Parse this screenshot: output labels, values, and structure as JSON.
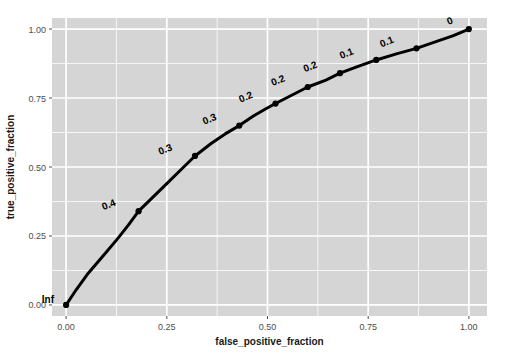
{
  "chart_data": {
    "type": "line",
    "title": "",
    "xlabel": "false_positive_fraction",
    "ylabel": "true_positive_fraction",
    "xlim": [
      -0.035,
      1.045
    ],
    "ylim": [
      -0.04,
      1.04
    ],
    "grid": true,
    "legend": false,
    "xticks": [
      "0.00",
      "0.25",
      "0.50",
      "0.75",
      "1.00"
    ],
    "xtickvals": [
      0,
      0.25,
      0.5,
      0.75,
      1.0
    ],
    "yticks": [
      "0.00",
      "0.25",
      "0.50",
      "0.75",
      "1.00"
    ],
    "ytickvals": [
      0,
      0.25,
      0.5,
      0.75,
      1.0
    ],
    "minor_xtickvals": [
      0.125,
      0.375,
      0.625,
      0.875
    ],
    "minor_ytickvals": [
      0.125,
      0.375,
      0.625,
      0.875
    ],
    "series": [
      {
        "name": "roc-curve",
        "color": "#000000",
        "x": [
          0.0,
          0.025,
          0.055,
          0.09,
          0.125,
          0.155,
          0.18,
          0.215,
          0.25,
          0.285,
          0.32,
          0.36,
          0.395,
          0.43,
          0.465,
          0.495,
          0.52,
          0.56,
          0.6,
          0.645,
          0.68,
          0.72,
          0.77,
          0.82,
          0.87,
          0.92,
          0.96,
          1.0
        ],
        "y": [
          0.0,
          0.055,
          0.115,
          0.175,
          0.235,
          0.29,
          0.34,
          0.39,
          0.44,
          0.49,
          0.54,
          0.585,
          0.62,
          0.65,
          0.685,
          0.71,
          0.73,
          0.76,
          0.79,
          0.815,
          0.84,
          0.862,
          0.888,
          0.91,
          0.93,
          0.955,
          0.975,
          1.0
        ]
      }
    ],
    "points": [
      {
        "x": 0.0,
        "y": 0.0,
        "label": "Inf",
        "lx": -0.03,
        "ly": 0.008,
        "rot": 0
      },
      {
        "x": 0.18,
        "y": 0.34,
        "label": "0.4",
        "lx": -0.055,
        "ly": 0.022,
        "rot": -22
      },
      {
        "x": 0.32,
        "y": 0.54,
        "label": "0.3",
        "lx": -0.055,
        "ly": 0.022,
        "rot": -22
      },
      {
        "x": 0.43,
        "y": 0.65,
        "label": "0.3",
        "lx": -0.055,
        "ly": 0.022,
        "rot": -22
      },
      {
        "x": 0.52,
        "y": 0.73,
        "label": "0.2",
        "lx": -0.055,
        "ly": 0.022,
        "rot": -22
      },
      {
        "x": 0.6,
        "y": 0.79,
        "label": "0.2",
        "lx": -0.055,
        "ly": 0.022,
        "rot": -22
      },
      {
        "x": 0.68,
        "y": 0.84,
        "label": "0.2",
        "lx": -0.055,
        "ly": 0.022,
        "rot": -22
      },
      {
        "x": 0.77,
        "y": 0.888,
        "label": "0.1",
        "lx": -0.055,
        "ly": 0.022,
        "rot": -22
      },
      {
        "x": 0.87,
        "y": 0.93,
        "label": "0.1",
        "lx": -0.055,
        "ly": 0.022,
        "rot": -22
      },
      {
        "x": 1.0,
        "y": 1.0,
        "label": "0",
        "lx": -0.038,
        "ly": 0.022,
        "rot": -22
      }
    ],
    "style": {
      "panel_bg": "#d5d5d5",
      "grid_major": "#ffffff",
      "grid_minor": "#ffffff",
      "line_color": "#000000",
      "point_color": "#000000",
      "plot_bg": "#ffffff",
      "tick_color": "#4d4d4d",
      "axis_title_color": "#1a1a1a"
    },
    "panel": {
      "left": 52,
      "right": 487,
      "top": 18,
      "bottom": 316
    }
  }
}
